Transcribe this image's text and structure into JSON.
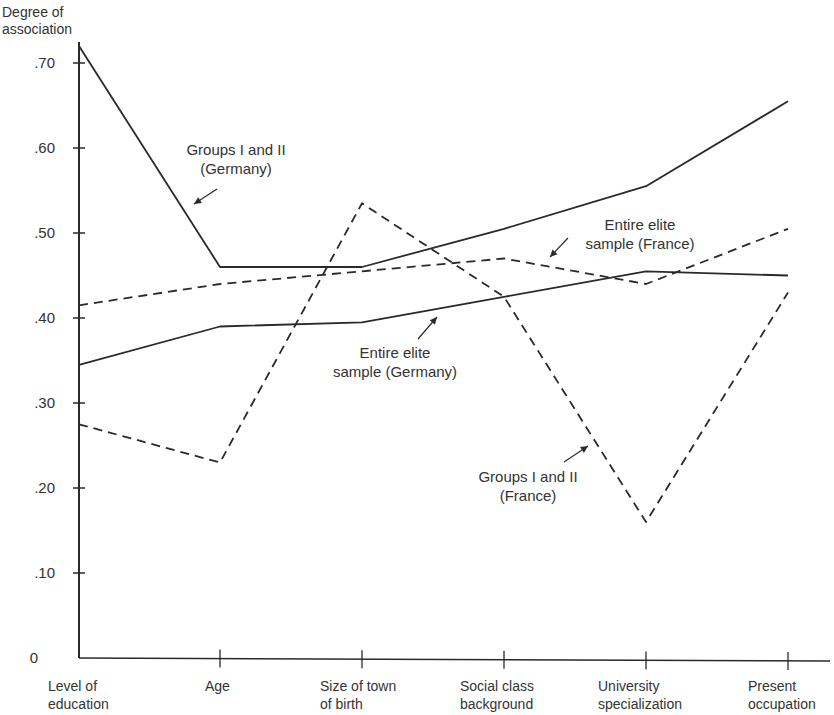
{
  "chart_data": {
    "type": "line",
    "title": "",
    "xlabel": "",
    "ylabel": "Degree of association",
    "ylabel_lines": [
      "Degree of",
      "association"
    ],
    "ylim": [
      0,
      0.72
    ],
    "grid": false,
    "legend_position": "inline annotations",
    "y_ticks": [
      {
        "value": 0,
        "label": "0"
      },
      {
        "value": 0.1,
        "label": ".10"
      },
      {
        "value": 0.2,
        "label": ".20"
      },
      {
        "value": 0.3,
        "label": ".30"
      },
      {
        "value": 0.4,
        "label": ".40"
      },
      {
        "value": 0.5,
        "label": ".50"
      },
      {
        "value": 0.6,
        "label": ".60"
      },
      {
        "value": 0.7,
        "label": ".70"
      }
    ],
    "categories": [
      "Level of education",
      "Age",
      "Size of town of birth",
      "Social class background",
      "University specialization",
      "Present occupation"
    ],
    "category_labels": [
      [
        "Level of",
        "education"
      ],
      [
        "Age",
        ""
      ],
      [
        "Size of town",
        "of birth"
      ],
      [
        "Social class",
        "background"
      ],
      [
        "University",
        "specialization"
      ],
      [
        "Present",
        "occupation"
      ]
    ],
    "series": [
      {
        "name": "Groups I and II (Germany)",
        "style": "solid",
        "values": [
          0.72,
          0.46,
          0.46,
          0.505,
          0.555,
          0.655
        ]
      },
      {
        "name": "Entire elite sample (Germany)",
        "style": "solid",
        "values": [
          0.345,
          0.39,
          0.395,
          0.425,
          0.455,
          0.45
        ]
      },
      {
        "name": "Entire elite sample (France)",
        "style": "dashed",
        "values": [
          0.415,
          0.44,
          0.455,
          0.47,
          0.44,
          0.505
        ]
      },
      {
        "name": "Groups I and II (France)",
        "style": "dashed",
        "values": [
          0.275,
          0.23,
          0.535,
          0.425,
          0.16,
          0.43
        ]
      }
    ],
    "annotations": [
      {
        "series": "Groups I and II (Germany)",
        "lines": [
          "Groups I and II",
          "(Germany)"
        ]
      },
      {
        "series": "Entire elite sample (Germany)",
        "lines": [
          "Entire elite",
          "sample (Germany)"
        ]
      },
      {
        "series": "Entire elite sample (France)",
        "lines": [
          "Entire elite",
          "sample (France)"
        ]
      },
      {
        "series": "Groups I and II (France)",
        "lines": [
          "Groups I and II",
          "(France)"
        ]
      }
    ]
  },
  "colors": {
    "ink": "#2a2a2a",
    "background": "#ffffff"
  }
}
